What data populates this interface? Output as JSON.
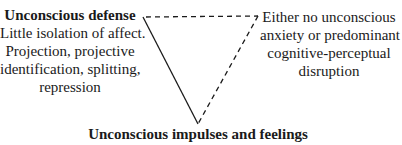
{
  "diagram": {
    "type": "inverted-triangle",
    "vertices": {
      "top_left": {
        "title": "Unconscious defense",
        "description_lines": [
          "Little isolation of affect.",
          "Projection, projective",
          "identification, splitting,",
          "repression"
        ]
      },
      "top_right": {
        "description_lines": [
          "Either no unconscious",
          "anxiety or predominant",
          "cognitive-perceptual",
          "disruption"
        ]
      },
      "bottom": {
        "title": "Unconscious impulses and feelings"
      }
    },
    "edges": [
      {
        "from": "top_left",
        "to": "bottom",
        "style": "solid"
      },
      {
        "from": "top_left",
        "to": "top_right",
        "style": "dashed"
      },
      {
        "from": "top_right",
        "to": "bottom",
        "style": "dashed"
      }
    ],
    "colors": {
      "line": "#1a1a1a",
      "text": "#1a1a1a",
      "background": "#ffffff"
    }
  }
}
